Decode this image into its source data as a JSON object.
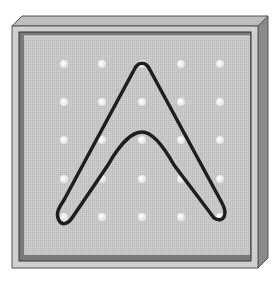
{
  "figure": {
    "colors": {
      "background": "#ffffff",
      "frame_top": "#bdbdbd",
      "frame_side": "#8a8a8a",
      "frame_face": "#c9c9c9",
      "board_border": "#6b6b6b",
      "board_inner": "#c4c4c4",
      "peg": "#f4f4f4",
      "band": "#1e1e1e"
    },
    "grid": {
      "rows": 5,
      "cols": 5,
      "x": [
        64,
        102,
        142,
        181,
        220
      ],
      "y": [
        64,
        102,
        140,
        179,
        217
      ]
    },
    "band": {
      "shape": "arch",
      "peak_peg": [
        3,
        1
      ],
      "left_foot_peg": [
        1,
        5
      ],
      "right_foot_peg": [
        5,
        5
      ],
      "inner_apex_y": 135
    }
  }
}
